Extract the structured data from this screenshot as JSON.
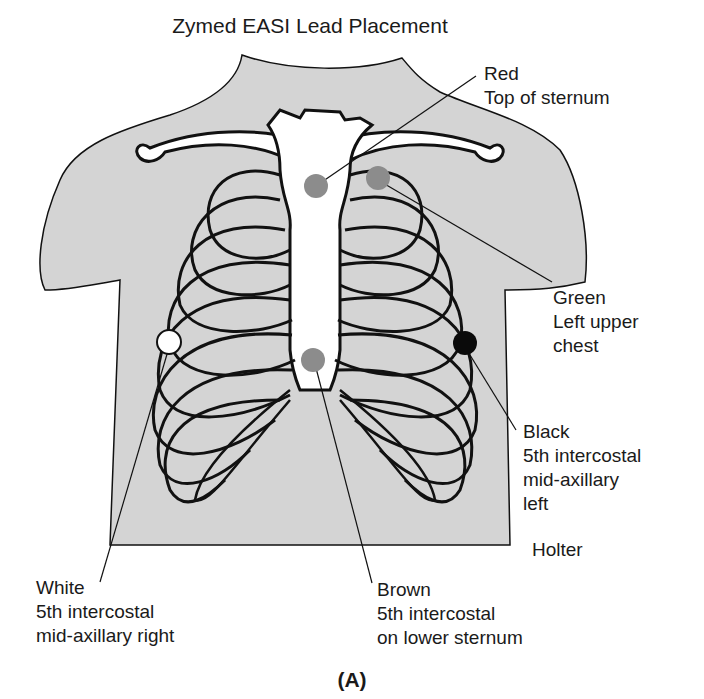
{
  "title": "Zymed EASI Lead Placement",
  "caption": "(A)",
  "colors": {
    "skin": "#d4d4d4",
    "bone": "#ffffff",
    "outline": "#111111",
    "electrode_gray": "#8c8c8c",
    "electrode_black": "#0a0a0a",
    "electrode_white": "#ffffff"
  },
  "electrodes": [
    {
      "id": "red",
      "lines": [
        "Red",
        "Top of sternum"
      ],
      "location": "top of sternum"
    },
    {
      "id": "green",
      "lines": [
        "Green",
        "Left upper",
        "chest"
      ],
      "location": "left upper chest"
    },
    {
      "id": "black",
      "lines": [
        "Black",
        "5th intercostal",
        "mid-axillary",
        "left"
      ],
      "location": "5th intercostal mid-axillary left"
    },
    {
      "id": "white",
      "lines": [
        "White",
        "5th intercostal",
        "mid-axillary right"
      ],
      "location": "5th intercostal mid-axillary right"
    },
    {
      "id": "brown",
      "lines": [
        "Brown",
        "5th intercostal",
        "on lower sternum"
      ],
      "location": "5th intercostal on lower sternum"
    }
  ],
  "extra_label": "Holter"
}
